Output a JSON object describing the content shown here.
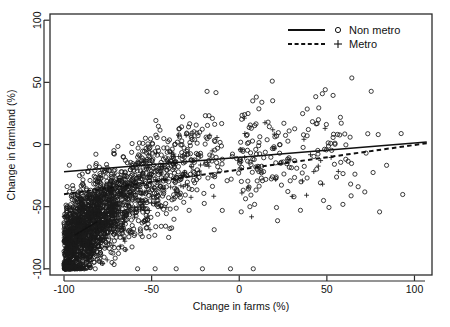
{
  "figure": {
    "cropped_caption_fragment": "",
    "background": "#ffffff",
    "foreground": "#111111"
  },
  "axes": {
    "x_title": "Change in farms (%)",
    "y_title": "Change in farmland (%)",
    "x_ticks": [
      "-100",
      "-50",
      "0",
      "50",
      "100"
    ],
    "y_ticks": [
      "-100",
      "-50",
      "0",
      "50",
      "100"
    ]
  },
  "legend": {
    "items": [
      {
        "label": "Non metro",
        "line_style": "solid",
        "marker": "circle-open-marker"
      },
      {
        "label": "Metro",
        "line_style": "dashed",
        "marker": "plus-marker"
      }
    ]
  },
  "chart_data": {
    "type": "scatter",
    "title": "",
    "xlabel": "Change in farms (%)",
    "ylabel": "Change in farmland (%)",
    "xlim": [
      -108,
      110
    ],
    "ylim": [
      -105,
      105
    ],
    "xticks": [
      -100,
      -50,
      0,
      50,
      100
    ],
    "yticks": [
      -100,
      -50,
      0,
      50,
      100
    ],
    "grid": false,
    "legend_position": "top-right",
    "series": [
      {
        "name": "Non metro",
        "marker": "circle-open",
        "n_points_approx": 2100,
        "fit_line": {
          "style": "solid",
          "x": [
            -100,
            107
          ],
          "y": [
            -22,
            2
          ],
          "slope": 0.116,
          "intercept": -10.4
        },
        "distribution": {
          "description": "dense positively-correlated cloud concentrated between x=-100 and x=-20, widening downward toward x=-100; long sparse tail to the right",
          "mode_x": -72,
          "mode_y": -42,
          "floor_pileup_y": -100
        }
      },
      {
        "name": "Metro",
        "marker": "plus",
        "n_points_approx": 330,
        "fit_line": {
          "style": "dashed",
          "x": [
            -100,
            107
          ],
          "y": [
            -40,
            1
          ],
          "slope": 0.198,
          "intercept": -20.2
        },
        "distribution": {
          "description": "sparser plus-marker cloud overlapping the circle cloud, shifted slightly lower",
          "mode_x": -68,
          "mode_y": -48,
          "floor_pileup_y": -100
        }
      }
    ],
    "extra_segment": {
      "name": "short-solid-segment-lower-left",
      "x": [
        -94,
        -81
      ],
      "y": [
        -73,
        -62
      ]
    }
  }
}
